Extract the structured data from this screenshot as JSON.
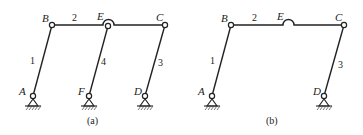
{
  "figure": {
    "panels": [
      {
        "caption": "(a)",
        "points": {
          "A": {
            "label": "A"
          },
          "B": {
            "label": "B"
          },
          "C": {
            "label": "C"
          },
          "D": {
            "label": "D"
          },
          "E": {
            "label": "E"
          },
          "F": {
            "label": "F"
          }
        },
        "links": {
          "l1": "1",
          "l2": "2",
          "l3": "3",
          "l4": "4"
        }
      },
      {
        "caption": "(b)",
        "points": {
          "A": {
            "label": "A"
          },
          "B": {
            "label": "B"
          },
          "C": {
            "label": "C"
          },
          "D": {
            "label": "D"
          },
          "E": {
            "label": "E"
          }
        },
        "links": {
          "l1": "1",
          "l2": "2",
          "l3": "3"
        }
      }
    ]
  }
}
